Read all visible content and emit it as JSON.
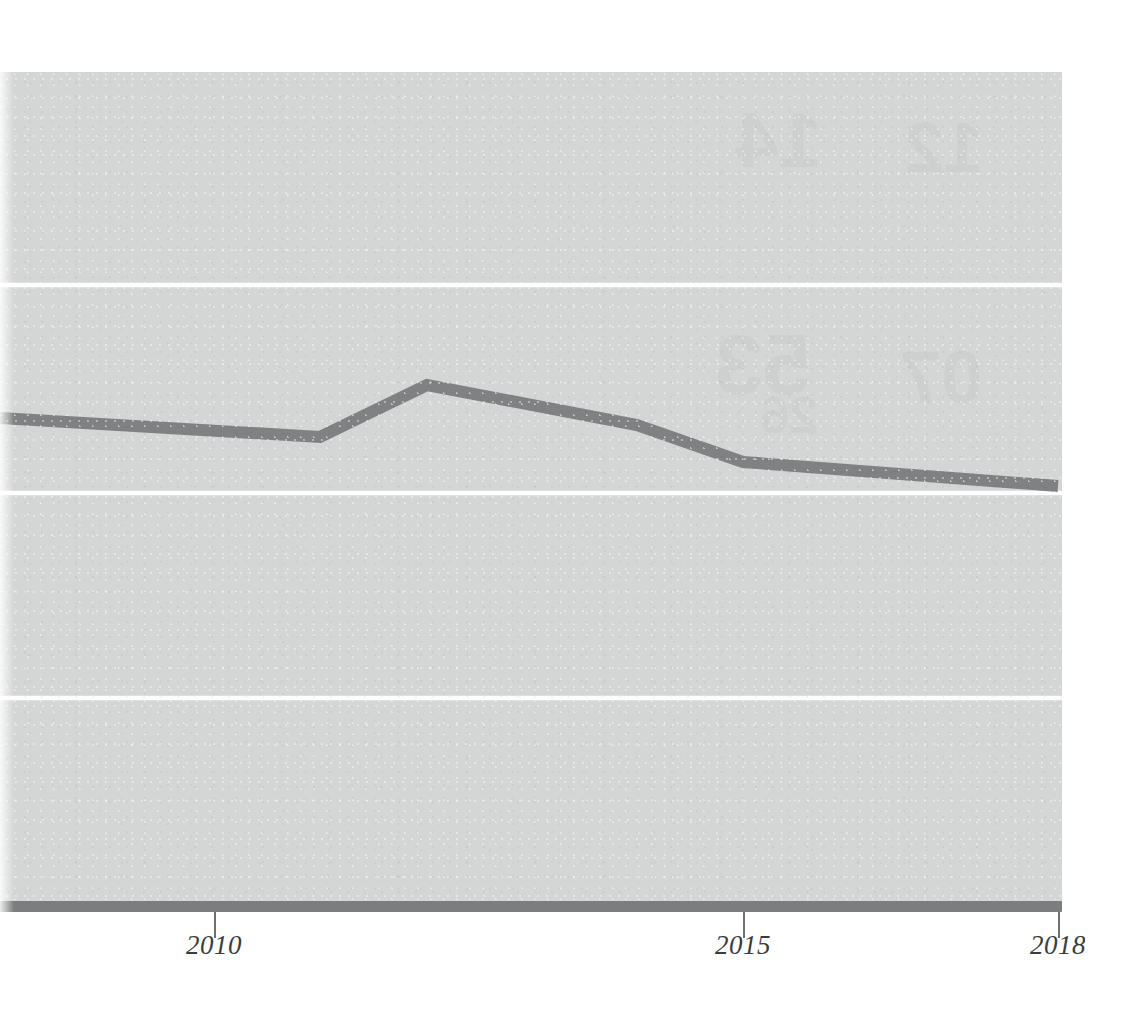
{
  "figure": {
    "background_color": "#ffffff",
    "panel_color": "#d4d5d5",
    "gridline_color": "#fdfdfd",
    "axis_color": "#7c7d7e",
    "series_color": "#808183",
    "tick_label_color": "#3b3c3e"
  },
  "axis": {
    "ticks": [
      {
        "label": "2010",
        "value": 2010,
        "x": 214
      },
      {
        "label": "2015",
        "value": 2015,
        "x": 743
      },
      {
        "label": "2018",
        "value": 2018,
        "x": 1058
      }
    ]
  },
  "gridlines": {
    "y_pixels": [
      283,
      491,
      696
    ],
    "count": 3
  },
  "bleed_through": [
    {
      "text": "14",
      "x": 735,
      "y": 95,
      "size": 78
    },
    {
      "text": "12",
      "x": 905,
      "y": 108,
      "size": 70
    },
    {
      "text": "53",
      "x": 715,
      "y": 315,
      "size": 86
    },
    {
      "text": "07",
      "x": 900,
      "y": 335,
      "size": 74
    },
    {
      "text": "26",
      "x": 760,
      "y": 385,
      "size": 52
    }
  ],
  "chart_data": {
    "type": "line",
    "title": "",
    "subtitle": "",
    "xlabel": "",
    "ylabel": "",
    "xlim": [
      2007.98,
      2018.0
    ],
    "ylim": [
      0,
      4
    ],
    "grid": true,
    "legend": null,
    "x_tick_labels": [
      "2010",
      "2015",
      "2018"
    ],
    "y_tick_labels": [],
    "note": "Y axis is unlabeled; values below are expressed in gridline units where the baseline = 0 and each white gridline is 1 unit apart (baseline y=903px, gridlines at 696, 491, 283px).",
    "series": [
      {
        "name": "series-1",
        "color": "#808183",
        "line_width_px": 12,
        "x": [
          2007.98,
          2011.0,
          2012.0,
          2014.0,
          2015.0,
          2018.0
        ],
        "values": [
          2.35,
          2.26,
          2.51,
          2.31,
          2.13,
          2.02
        ],
        "points_px": [
          {
            "x": 0,
            "y": 418
          },
          {
            "x": 320,
            "y": 437
          },
          {
            "x": 427,
            "y": 385
          },
          {
            "x": 637,
            "y": 425
          },
          {
            "x": 743,
            "y": 462
          },
          {
            "x": 1058,
            "y": 486
          }
        ]
      }
    ]
  }
}
